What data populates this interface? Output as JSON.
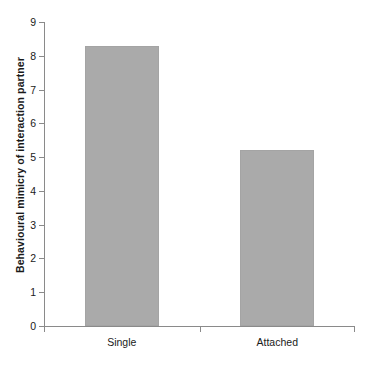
{
  "chart_data": {
    "type": "bar",
    "title": "",
    "xlabel": "",
    "ylabel": "Behavioural mimicry of interaction partner",
    "categories": [
      "Single",
      "Attached"
    ],
    "values": [
      8.3,
      5.2
    ],
    "ylim": [
      0,
      9
    ],
    "yticks": [
      0,
      1,
      2,
      3,
      4,
      5,
      6,
      7,
      8,
      9
    ],
    "ytick_labels": [
      "0",
      "1",
      "2",
      "3",
      "4",
      "5",
      "6",
      "7",
      "8",
      "9"
    ],
    "grid": false,
    "legend": null,
    "bar_color": "#aaaaaa",
    "axis_color": "#8a8a8a",
    "text_color": "#1a1a1a",
    "background": "#ffffff"
  }
}
